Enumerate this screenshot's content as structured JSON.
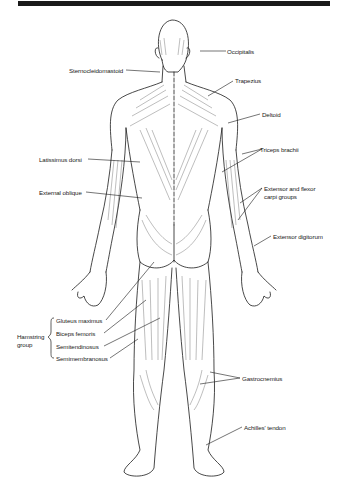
{
  "diagram": {
    "title_bar_color": "#1a1a1a",
    "view": "posterior",
    "labels": {
      "occipitalis": "Occipitalis",
      "sternocleidomastoid": "Sternocleidomastoid",
      "trapezius": "Trapezius",
      "deltoid": "Deltoid",
      "triceps_brachii": "Triceps brachii",
      "latissimus_dorsi": "Latissimus dorsi",
      "external_oblique": "External oblique",
      "extensor_flexor_carpi_line1": "Extensor and flexor",
      "extensor_flexor_carpi_line2": "carpi groups",
      "extensor_digitorum": "Extensor digitorum",
      "hamstring_group_line1": "Hamstring",
      "hamstring_group_line2": "group",
      "gluteus_maximus": "Gluteus maximus",
      "biceps_femoris": "Biceps femoris",
      "semitendinosus": "Semitendinosus",
      "semimembranosus": "Semimembranosus",
      "gastrocnemius": "Gastrocnemius",
      "achilles_tendon": "Achilles' tendon"
    }
  }
}
